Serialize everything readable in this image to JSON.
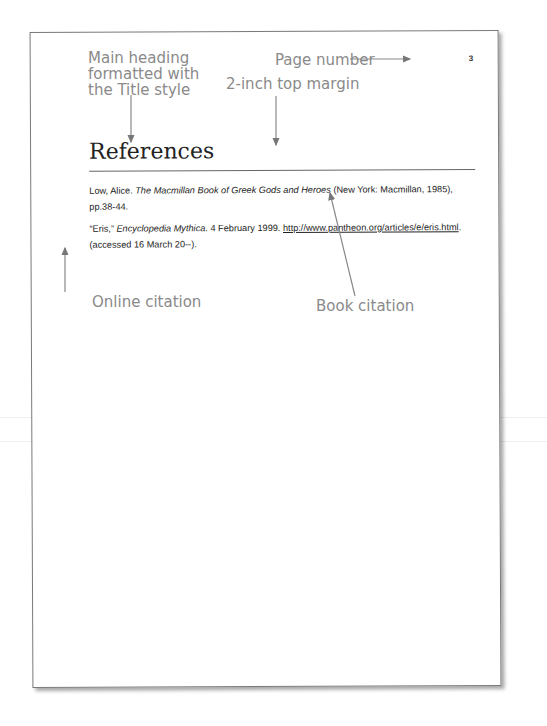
{
  "page": {
    "number": "3",
    "heading": "References",
    "citations": [
      {
        "author": "Low, Alice. ",
        "title": "The Macmillan Book of Greek Gods and Heroes",
        "rest": " (New York: Macmillan, 1985), pp.38-44."
      },
      {
        "entry": "“Eris,” ",
        "title": "Encyclopedia Mythica",
        "date": ". 4 February 1999. ",
        "url": "http://www.pantheon.org/articles/e/eris.html",
        "rest": ". (accessed 16 March 20--)."
      }
    ]
  },
  "callouts": {
    "main_heading": "Main heading formatted with the Title style",
    "main_heading_lines": [
      "Main heading",
      "formatted with",
      "the Title style"
    ],
    "page_number": "Page number",
    "top_margin": "2-inch top margin",
    "online_citation": "Online citation",
    "book_citation": "Book citation"
  }
}
